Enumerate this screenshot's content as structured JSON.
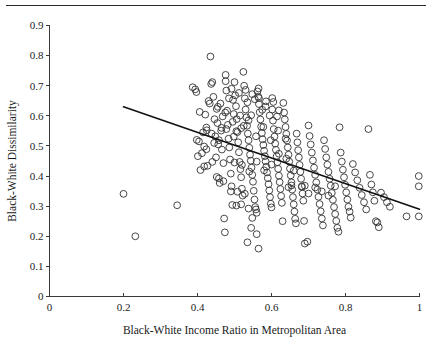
{
  "chart_data": {
    "type": "scatter",
    "title": "",
    "xlabel": "Black-White Income Ratio in Metropolitan Area",
    "ylabel": "Black-White Dissimilarity",
    "xlim": [
      0,
      1
    ],
    "ylim": [
      0,
      0.9
    ],
    "grid": false,
    "legend": null,
    "xticks": [
      "0",
      "0.2",
      "0.4",
      "0.6",
      "0.8",
      "1"
    ],
    "xtick_values": [
      0,
      0.2,
      0.4,
      0.6,
      0.8,
      1
    ],
    "yticks": [
      "0",
      "0.1",
      "0.2",
      "0.3",
      "0.4",
      "0.5",
      "0.6",
      "0.7",
      "0.8",
      "0.9"
    ],
    "ytick_values": [
      0,
      0.1,
      0.2,
      0.3,
      0.4,
      0.5,
      0.6,
      0.7,
      0.8,
      0.9
    ],
    "marker": "open-circle",
    "marker_color": "#333333",
    "trend_line": {
      "name": "linear fit",
      "x_start": 0.2,
      "y_start": 0.63,
      "x_end": 1.0,
      "y_end": 0.29,
      "color": "#111111"
    },
    "series": [
      {
        "name": "Metropolitan areas",
        "points": [
          [
            0.2,
            0.341
          ],
          [
            0.232,
            0.2
          ],
          [
            0.345,
            0.303
          ],
          [
            0.387,
            0.695
          ],
          [
            0.394,
            0.688
          ],
          [
            0.397,
            0.679
          ],
          [
            0.398,
            0.52
          ],
          [
            0.401,
            0.466
          ],
          [
            0.404,
            0.515
          ],
          [
            0.406,
            0.613
          ],
          [
            0.408,
            0.42
          ],
          [
            0.412,
            0.476
          ],
          [
            0.415,
            0.545
          ],
          [
            0.418,
            0.498
          ],
          [
            0.421,
            0.604
          ],
          [
            0.424,
            0.561
          ],
          [
            0.427,
            0.434
          ],
          [
            0.43,
            0.649
          ],
          [
            0.435,
            0.797
          ],
          [
            0.437,
            0.706
          ],
          [
            0.44,
            0.712
          ],
          [
            0.443,
            0.663
          ],
          [
            0.446,
            0.589
          ],
          [
            0.448,
            0.532
          ],
          [
            0.45,
            0.462
          ],
          [
            0.452,
            0.623
          ],
          [
            0.454,
            0.576
          ],
          [
            0.456,
            0.505
          ],
          [
            0.458,
            0.392
          ],
          [
            0.46,
            0.377
          ],
          [
            0.462,
            0.641
          ],
          [
            0.464,
            0.551
          ],
          [
            0.466,
            0.488
          ],
          [
            0.468,
            0.598
          ],
          [
            0.47,
            0.443
          ],
          [
            0.472,
            0.259
          ],
          [
            0.474,
            0.213
          ],
          [
            0.476,
            0.736
          ],
          [
            0.478,
            0.684
          ],
          [
            0.48,
            0.617
          ],
          [
            0.482,
            0.57
          ],
          [
            0.484,
            0.524
          ],
          [
            0.486,
            0.495
          ],
          [
            0.488,
            0.455
          ],
          [
            0.49,
            0.408
          ],
          [
            0.492,
            0.366
          ],
          [
            0.494,
            0.304
          ],
          [
            0.496,
            0.653
          ],
          [
            0.498,
            0.606
          ],
          [
            0.5,
            0.712
          ],
          [
            0.502,
            0.668
          ],
          [
            0.504,
            0.632
          ],
          [
            0.506,
            0.589
          ],
          [
            0.508,
            0.546
          ],
          [
            0.51,
            0.512
          ],
          [
            0.512,
            0.479
          ],
          [
            0.514,
            0.447
          ],
          [
            0.516,
            0.423
          ],
          [
            0.518,
            0.396
          ],
          [
            0.52,
            0.358
          ],
          [
            0.522,
            0.335
          ],
          [
            0.524,
            0.746
          ],
          [
            0.526,
            0.7
          ],
          [
            0.528,
            0.658
          ],
          [
            0.53,
            0.621
          ],
          [
            0.532,
            0.595
          ],
          [
            0.534,
            0.567
          ],
          [
            0.536,
            0.541
          ],
          [
            0.538,
            0.519
          ],
          [
            0.54,
            0.494
          ],
          [
            0.542,
            0.471
          ],
          [
            0.544,
            0.451
          ],
          [
            0.546,
            0.428
          ],
          [
            0.548,
            0.404
          ],
          [
            0.55,
            0.381
          ],
          [
            0.552,
            0.351
          ],
          [
            0.554,
            0.322
          ],
          [
            0.556,
            0.297
          ],
          [
            0.558,
            0.289
          ],
          [
            0.56,
            0.278
          ],
          [
            0.562,
            0.681
          ],
          [
            0.564,
            0.664
          ],
          [
            0.566,
            0.639
          ],
          [
            0.568,
            0.612
          ],
          [
            0.57,
            0.588
          ],
          [
            0.572,
            0.564
          ],
          [
            0.574,
            0.543
          ],
          [
            0.576,
            0.522
          ],
          [
            0.578,
            0.503
          ],
          [
            0.58,
            0.484
          ],
          [
            0.582,
            0.466
          ],
          [
            0.584,
            0.449
          ],
          [
            0.586,
            0.431
          ],
          [
            0.588,
            0.412
          ],
          [
            0.59,
            0.393
          ],
          [
            0.592,
            0.373
          ],
          [
            0.594,
            0.352
          ],
          [
            0.596,
            0.33
          ],
          [
            0.598,
            0.308
          ],
          [
            0.6,
            0.296
          ],
          [
            0.425,
            0.552
          ],
          [
            0.433,
            0.641
          ],
          [
            0.445,
            0.51
          ],
          [
            0.455,
            0.63
          ],
          [
            0.465,
            0.56
          ],
          [
            0.475,
            0.611
          ],
          [
            0.485,
            0.658
          ],
          [
            0.495,
            0.58
          ],
          [
            0.505,
            0.549
          ],
          [
            0.515,
            0.601
          ],
          [
            0.525,
            0.567
          ],
          [
            0.535,
            0.645
          ],
          [
            0.545,
            0.602
          ],
          [
            0.555,
            0.655
          ],
          [
            0.565,
            0.691
          ],
          [
            0.575,
            0.62
          ],
          [
            0.585,
            0.648
          ],
          [
            0.595,
            0.601
          ],
          [
            0.605,
            0.646
          ],
          [
            0.615,
            0.598
          ],
          [
            0.508,
            0.348
          ],
          [
            0.518,
            0.306
          ],
          [
            0.528,
            0.341
          ],
          [
            0.538,
            0.292
          ],
          [
            0.548,
            0.261
          ],
          [
            0.56,
            0.207
          ],
          [
            0.535,
            0.18
          ],
          [
            0.565,
            0.159
          ],
          [
            0.545,
            0.228
          ],
          [
            0.602,
            0.621
          ],
          [
            0.604,
            0.584
          ],
          [
            0.606,
            0.556
          ],
          [
            0.608,
            0.531
          ],
          [
            0.61,
            0.508
          ],
          [
            0.612,
            0.487
          ],
          [
            0.614,
            0.466
          ],
          [
            0.616,
            0.446
          ],
          [
            0.618,
            0.424
          ],
          [
            0.62,
            0.401
          ],
          [
            0.622,
            0.38
          ],
          [
            0.624,
            0.357
          ],
          [
            0.626,
            0.334
          ],
          [
            0.628,
            0.311
          ],
          [
            0.63,
            0.25
          ],
          [
            0.632,
            0.643
          ],
          [
            0.634,
            0.611
          ],
          [
            0.636,
            0.588
          ],
          [
            0.638,
            0.563
          ],
          [
            0.64,
            0.54
          ],
          [
            0.642,
            0.518
          ],
          [
            0.644,
            0.495
          ],
          [
            0.646,
            0.471
          ],
          [
            0.648,
            0.448
          ],
          [
            0.65,
            0.425
          ],
          [
            0.652,
            0.402
          ],
          [
            0.654,
            0.379
          ],
          [
            0.656,
            0.355
          ],
          [
            0.658,
            0.33
          ],
          [
            0.66,
            0.306
          ],
          [
            0.662,
            0.282
          ],
          [
            0.664,
            0.258
          ],
          [
            0.666,
            0.243
          ],
          [
            0.668,
            0.541
          ],
          [
            0.67,
            0.512
          ],
          [
            0.672,
            0.486
          ],
          [
            0.674,
            0.462
          ],
          [
            0.676,
            0.437
          ],
          [
            0.678,
            0.414
          ],
          [
            0.68,
            0.391
          ],
          [
            0.682,
            0.366
          ],
          [
            0.684,
            0.342
          ],
          [
            0.686,
            0.318
          ],
          [
            0.688,
            0.251
          ],
          [
            0.69,
            0.176
          ],
          [
            0.697,
            0.182
          ],
          [
            0.7,
            0.568
          ],
          [
            0.703,
            0.533
          ],
          [
            0.706,
            0.505
          ],
          [
            0.709,
            0.478
          ],
          [
            0.712,
            0.452
          ],
          [
            0.715,
            0.428
          ],
          [
            0.718,
            0.404
          ],
          [
            0.721,
            0.379
          ],
          [
            0.724,
            0.355
          ],
          [
            0.727,
            0.331
          ],
          [
            0.73,
            0.307
          ],
          [
            0.733,
            0.283
          ],
          [
            0.736,
            0.259
          ],
          [
            0.739,
            0.236
          ],
          [
            0.742,
            0.519
          ],
          [
            0.745,
            0.49
          ],
          [
            0.748,
            0.462
          ],
          [
            0.751,
            0.438
          ],
          [
            0.754,
            0.414
          ],
          [
            0.757,
            0.391
          ],
          [
            0.76,
            0.368
          ],
          [
            0.763,
            0.344
          ],
          [
            0.766,
            0.321
          ],
          [
            0.769,
            0.297
          ],
          [
            0.772,
            0.274
          ],
          [
            0.775,
            0.251
          ],
          [
            0.778,
            0.228
          ],
          [
            0.781,
            0.215
          ],
          [
            0.784,
            0.562
          ],
          [
            0.787,
            0.478
          ],
          [
            0.79,
            0.448
          ],
          [
            0.793,
            0.421
          ],
          [
            0.796,
            0.396
          ],
          [
            0.799,
            0.371
          ],
          [
            0.802,
            0.346
          ],
          [
            0.805,
            0.322
          ],
          [
            0.808,
            0.298
          ],
          [
            0.811,
            0.282
          ],
          [
            0.814,
            0.262
          ],
          [
            0.82,
            0.44
          ],
          [
            0.826,
            0.412
          ],
          [
            0.832,
            0.386
          ],
          [
            0.838,
            0.361
          ],
          [
            0.844,
            0.337
          ],
          [
            0.85,
            0.313
          ],
          [
            0.856,
            0.289
          ],
          [
            0.862,
            0.556
          ],
          [
            0.866,
            0.404
          ],
          [
            0.87,
            0.372
          ],
          [
            0.874,
            0.346
          ],
          [
            0.878,
            0.318
          ],
          [
            0.882,
            0.25
          ],
          [
            0.886,
            0.246
          ],
          [
            0.89,
            0.23
          ],
          [
            0.896,
            0.345
          ],
          [
            0.904,
            0.33
          ],
          [
            0.912,
            0.313
          ],
          [
            0.92,
            0.298
          ],
          [
            0.965,
            0.266
          ],
          [
            0.998,
            0.4
          ],
          [
            0.998,
            0.366
          ],
          [
            0.998,
            0.266
          ],
          [
            0.646,
            0.363
          ],
          [
            0.654,
            0.369
          ],
          [
            0.682,
            0.364
          ],
          [
            0.69,
            0.368
          ],
          [
            0.7,
            0.342
          ],
          [
            0.718,
            0.362
          ],
          [
            0.736,
            0.349
          ],
          [
            0.754,
            0.335
          ],
          [
            0.772,
            0.366
          ],
          [
            0.424,
            0.489
          ],
          [
            0.44,
            0.447
          ],
          [
            0.452,
            0.397
          ],
          [
            0.47,
            0.383
          ],
          [
            0.49,
            0.349
          ],
          [
            0.505,
            0.302
          ],
          [
            0.418,
            0.432
          ],
          [
            0.438,
            0.541
          ],
          [
            0.458,
            0.519
          ],
          [
            0.478,
            0.556
          ],
          [
            0.498,
            0.531
          ],
          [
            0.518,
            0.559
          ],
          [
            0.538,
            0.585
          ],
          [
            0.558,
            0.532
          ],
          [
            0.578,
            0.563
          ],
          [
            0.598,
            0.519
          ],
          [
            0.618,
            0.551
          ],
          [
            0.638,
            0.524
          ],
          [
            0.476,
            0.715
          ],
          [
            0.492,
            0.69
          ],
          [
            0.512,
            0.676
          ],
          [
            0.53,
            0.686
          ],
          [
            0.548,
            0.672
          ],
          [
            0.566,
            0.659
          ],
          [
            0.584,
            0.631
          ],
          [
            0.602,
            0.659
          ],
          [
            0.62,
            0.618
          ],
          [
            0.5,
            0.445
          ],
          [
            0.52,
            0.437
          ],
          [
            0.54,
            0.415
          ],
          [
            0.56,
            0.448
          ],
          [
            0.58,
            0.419
          ],
          [
            0.6,
            0.438
          ],
          [
            0.62,
            0.474
          ],
          [
            0.64,
            0.458
          ],
          [
            0.66,
            0.418
          ]
        ]
      }
    ]
  }
}
